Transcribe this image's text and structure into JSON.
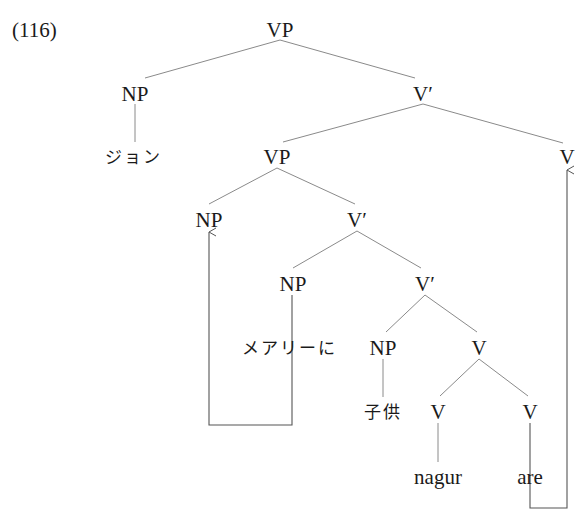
{
  "example_number": "(116)",
  "colors": {
    "branch": "#8a8a8a",
    "arrow": "#555555",
    "text": "#1a1a1a"
  },
  "nodes": {
    "root_vp": {
      "label": "VP",
      "x": 280,
      "y": 30
    },
    "np_john": {
      "label": "NP",
      "x": 135,
      "y": 94
    },
    "john": {
      "label": "ジョン",
      "x": 133,
      "y": 157
    },
    "vbar1": {
      "label": "V′",
      "x": 423,
      "y": 94
    },
    "vp2": {
      "label": "VP",
      "x": 277,
      "y": 157
    },
    "v_top": {
      "label": "V",
      "x": 567,
      "y": 157
    },
    "np_trace": {
      "label": "NP",
      "x": 209,
      "y": 220
    },
    "vbar2": {
      "label": "V′",
      "x": 357,
      "y": 220
    },
    "np_mary": {
      "label": "NP",
      "x": 293,
      "y": 284
    },
    "vbar3": {
      "label": "V′",
      "x": 425,
      "y": 284
    },
    "mary": {
      "label": "メアリーに",
      "x": 289,
      "y": 348
    },
    "np_child": {
      "label": "NP",
      "x": 383,
      "y": 348
    },
    "v4": {
      "label": "V",
      "x": 479,
      "y": 348
    },
    "child": {
      "label": "子供",
      "x": 383,
      "y": 412
    },
    "v5": {
      "label": "V",
      "x": 438,
      "y": 412
    },
    "v6": {
      "label": "V",
      "x": 530,
      "y": 412
    },
    "nagur": {
      "label": "nagur",
      "x": 438,
      "y": 477
    },
    "are": {
      "label": "are",
      "x": 530,
      "y": 477
    }
  }
}
